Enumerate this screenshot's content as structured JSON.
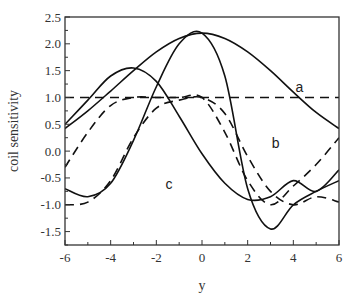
{
  "chart_data": {
    "type": "line",
    "title": "",
    "xlabel": "y",
    "ylabel": "coil sensitivity",
    "xlim": [
      -6,
      6
    ],
    "ylim": [
      -1.75,
      2.5
    ],
    "xticks": [
      -6,
      -4,
      -2,
      0,
      2,
      4,
      6
    ],
    "yticks": [
      -1.5,
      -1.0,
      -0.5,
      0.0,
      0.5,
      1.0,
      1.5,
      2.0,
      2.5
    ],
    "xtick_labels": [
      "-6",
      "-4",
      "-2",
      "0",
      "2",
      "4",
      "6"
    ],
    "ytick_labels": [
      "-1.5",
      "-1.0",
      "-0.5",
      "0.0",
      "0.5",
      "1.0",
      "1.5",
      "2.0",
      "2.5"
    ],
    "grid": false,
    "legend": "none (curves labeled inline)",
    "annotations": [
      {
        "text": "a",
        "x": 4.1,
        "y": 1.1
      },
      {
        "text": "b",
        "x": 3.05,
        "y": 0.05
      },
      {
        "text": "c",
        "x": -1.6,
        "y": -0.7
      }
    ],
    "series": [
      {
        "name": "a (solid)",
        "style": "solid",
        "x": [
          -6,
          -5,
          -4,
          -3,
          -2,
          -1,
          0,
          1,
          2,
          3,
          4,
          5,
          6
        ],
        "values": [
          0.42,
          0.75,
          1.12,
          1.5,
          1.85,
          2.1,
          2.2,
          2.1,
          1.85,
          1.5,
          1.1,
          0.72,
          0.42
        ]
      },
      {
        "name": "a (dashed)",
        "style": "dashed",
        "x": [
          -6,
          6
        ],
        "values": [
          1.0,
          1.0
        ]
      },
      {
        "name": "b (solid)",
        "style": "solid",
        "x": [
          -6,
          -5,
          -4,
          -3,
          -2,
          -1,
          0,
          1,
          2,
          3,
          4,
          5,
          6
        ],
        "values": [
          0.5,
          0.95,
          1.4,
          1.55,
          1.3,
          0.65,
          -0.05,
          -0.6,
          -0.9,
          -0.85,
          -0.55,
          -0.75,
          -0.35
        ]
      },
      {
        "name": "b (dashed)",
        "style": "dashed",
        "x": [
          -6,
          -5,
          -4,
          -3,
          -2,
          -1,
          0,
          1,
          2,
          3,
          4,
          5,
          6
        ],
        "values": [
          -0.3,
          0.35,
          0.85,
          1.0,
          1.0,
          1.0,
          1.0,
          0.35,
          -0.55,
          -1.0,
          -0.65,
          -0.25,
          0.25
        ]
      },
      {
        "name": "c (solid)",
        "style": "solid",
        "x": [
          -6,
          -5,
          -4,
          -3,
          -2,
          -1,
          0,
          1,
          2,
          3,
          4,
          5,
          6
        ],
        "values": [
          -0.7,
          -0.85,
          -0.6,
          0.2,
          1.2,
          2.0,
          2.2,
          1.4,
          -0.7,
          -1.45,
          -1.0,
          -0.75,
          -0.55
        ]
      },
      {
        "name": "c (dashed)",
        "style": "dashed",
        "x": [
          -6,
          -5,
          -4,
          -3,
          -2,
          -1,
          0,
          1,
          2,
          3,
          4,
          5,
          6
        ],
        "values": [
          -1.0,
          -0.95,
          -0.55,
          0.25,
          0.8,
          0.95,
          1.0,
          0.7,
          -0.1,
          -0.75,
          -1.0,
          -0.85,
          -0.95
        ]
      }
    ]
  }
}
